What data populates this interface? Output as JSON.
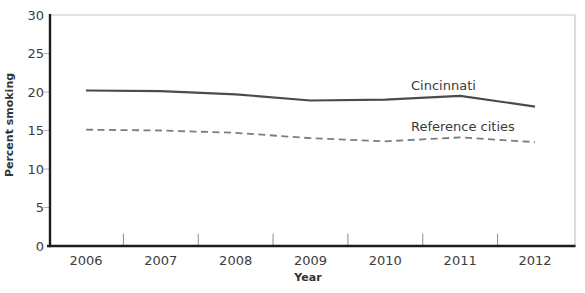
{
  "figure": {
    "background": "#ffffff"
  },
  "chart_data": {
    "type": "line",
    "title": "",
    "xlabel": "Year",
    "ylabel": "Percent smoking",
    "x": [
      2006,
      2007,
      2008,
      2009,
      2010,
      2011,
      2012
    ],
    "ylim": [
      0,
      30
    ],
    "yticks": [
      0,
      5,
      10,
      15,
      20,
      25,
      30
    ],
    "grid": false,
    "legend_position": "inline-annotations",
    "series": [
      {
        "name": "Cincinnati",
        "line_style": "solid",
        "color": "#4b4b4b",
        "values": [
          20.2,
          20.1,
          19.7,
          18.9,
          19.0,
          19.5,
          18.1
        ]
      },
      {
        "name": "Reference cities",
        "line_style": "dashed",
        "color": "#7d7d7d",
        "values": [
          15.1,
          15.0,
          14.7,
          14.0,
          13.6,
          14.1,
          13.5
        ]
      }
    ],
    "colors": {
      "axis": "#1c1c1c",
      "plot_border": "#c6c6c6",
      "x_tick": "#8c8c8c",
      "y_tick": "#b3b3b3",
      "text": "#3c3c3c"
    }
  }
}
